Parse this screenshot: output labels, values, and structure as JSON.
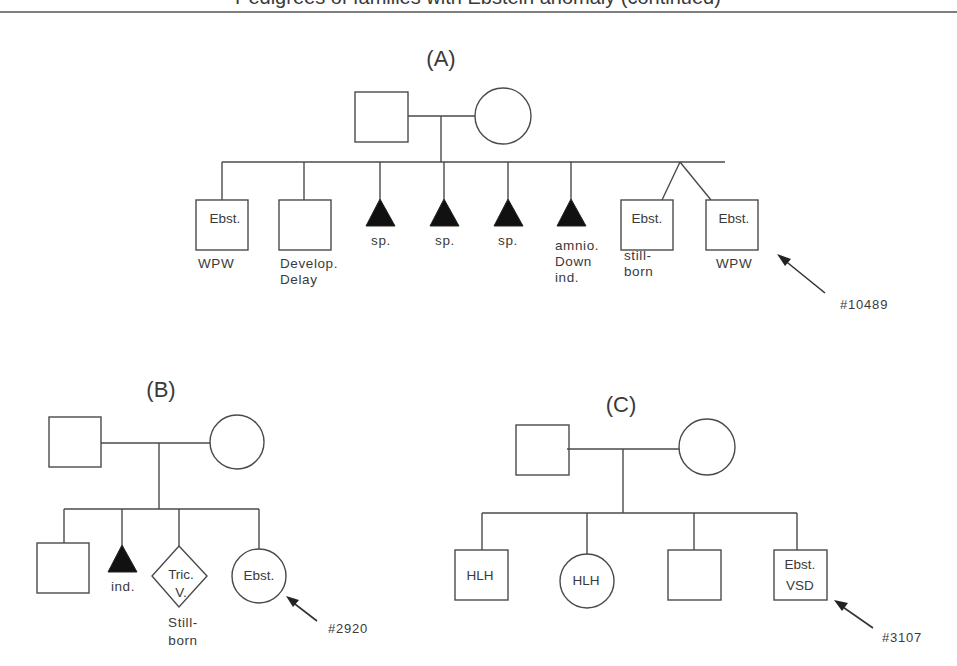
{
  "header": {
    "title_clipped": "Pedigrees of families with Ebstein anomaly (continued)"
  },
  "pedigrees": {
    "A": {
      "label": "(A)",
      "proband_id": "#10489",
      "children": [
        {
          "sex": "male",
          "inside": "Ebst.",
          "below": [
            "WPW"
          ]
        },
        {
          "sex": "male",
          "inside": "",
          "below": [
            "Develop.",
            "Delay"
          ]
        },
        {
          "sex": "pregnancy-loss",
          "inside": "",
          "below": [
            "sp."
          ]
        },
        {
          "sex": "pregnancy-loss",
          "inside": "",
          "below": [
            "sp."
          ]
        },
        {
          "sex": "pregnancy-loss",
          "inside": "",
          "below": [
            "sp."
          ]
        },
        {
          "sex": "pregnancy-loss",
          "inside": "",
          "below": [
            "amnio.",
            "Down",
            "ind."
          ]
        },
        {
          "sex": "male-twin",
          "inside": "Ebst.",
          "below": [
            "still-",
            "born"
          ]
        },
        {
          "sex": "male-twin",
          "inside": "Ebst.",
          "below": [
            "WPW"
          ]
        }
      ]
    },
    "B": {
      "label": "(B)",
      "proband_id": "#2920",
      "children": [
        {
          "sex": "male",
          "inside": "",
          "below": []
        },
        {
          "sex": "pregnancy-loss",
          "inside": "",
          "below": [
            "ind."
          ]
        },
        {
          "sex": "unknown",
          "inside": [
            "Tric.",
            "V."
          ],
          "below": [
            "Still-",
            "born"
          ]
        },
        {
          "sex": "female",
          "inside": "Ebst.",
          "below": []
        }
      ]
    },
    "C": {
      "label": "(C)",
      "proband_id": "#3107",
      "children": [
        {
          "sex": "male",
          "inside": "HLH",
          "below": []
        },
        {
          "sex": "female",
          "inside": "HLH",
          "below": []
        },
        {
          "sex": "male",
          "inside": "",
          "below": []
        },
        {
          "sex": "male",
          "inside": [
            "Ebst.",
            "VSD"
          ],
          "below": []
        }
      ]
    }
  },
  "colors": {
    "line": "#4a4a4a",
    "affected_fill": "#111111",
    "text": "#3a3a3a"
  }
}
